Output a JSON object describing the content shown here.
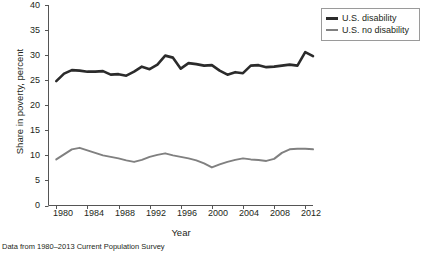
{
  "figure": {
    "clipped_title": "",
    "footnote": "Data from 1980–2013 Current Population Survey"
  },
  "legend": {
    "position": "top-right",
    "entries": [
      {
        "label": "U.S. disability",
        "swatch": "dark-line-swatch",
        "color": "#2b2b2b"
      },
      {
        "label": "U.S. no disability",
        "swatch": "gray-line-swatch",
        "color": "#808080"
      }
    ]
  },
  "axes": {
    "ylabel": "Share in poverty, percent",
    "xlabel": "Year",
    "yticks": [
      "0",
      "5",
      "10",
      "15",
      "20",
      "25",
      "30",
      "35",
      "40"
    ],
    "xticks": [
      "1980",
      "1984",
      "1988",
      "1992",
      "1996",
      "2000",
      "2004",
      "2008",
      "2012"
    ]
  },
  "chart_data": {
    "type": "line",
    "title": "",
    "xlabel": "Year",
    "ylabel": "Share in poverty, percent",
    "xlim": [
      1979,
      2013
    ],
    "ylim": [
      0,
      40
    ],
    "ytick_step": 5,
    "xtick_step": 4,
    "grid": false,
    "legend_position": "top-right",
    "x": [
      1980,
      1981,
      1982,
      1983,
      1984,
      1985,
      1986,
      1987,
      1988,
      1989,
      1990,
      1991,
      1992,
      1993,
      1994,
      1995,
      1996,
      1997,
      1998,
      1999,
      2000,
      2001,
      2002,
      2003,
      2004,
      2005,
      2006,
      2007,
      2008,
      2009,
      2010,
      2011,
      2012,
      2013
    ],
    "series": [
      {
        "name": "U.S. disability",
        "color": "#2b2b2b",
        "values": [
          24.8,
          26.3,
          27.0,
          26.9,
          26.7,
          26.7,
          26.8,
          26.1,
          26.2,
          25.9,
          26.7,
          27.7,
          27.2,
          28.1,
          29.9,
          29.5,
          27.3,
          28.4,
          28.2,
          27.9,
          28.0,
          26.9,
          26.1,
          26.6,
          26.4,
          27.9,
          28.0,
          27.6,
          27.7,
          27.9,
          28.1,
          27.9,
          30.6,
          29.8
        ]
      },
      {
        "name": "U.S. no disability",
        "color": "#808080",
        "values": [
          9.2,
          10.2,
          11.2,
          11.5,
          11.0,
          10.5,
          10.0,
          9.7,
          9.4,
          9.0,
          8.7,
          9.1,
          9.7,
          10.1,
          10.4,
          10.0,
          9.7,
          9.4,
          9.0,
          8.4,
          7.6,
          8.2,
          8.7,
          9.1,
          9.4,
          9.2,
          9.1,
          8.9,
          9.3,
          10.5,
          11.2,
          11.3,
          11.3,
          11.2
        ]
      }
    ]
  }
}
